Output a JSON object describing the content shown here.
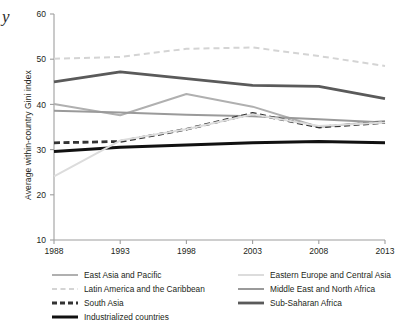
{
  "stray_glyph": "y",
  "axis": {
    "y_title": "Average within-country Gini index",
    "y_ticks": [
      "60",
      "50",
      "40",
      "30",
      "20",
      "10"
    ],
    "x_ticks": [
      "1988",
      "1993",
      "1998",
      "2003",
      "2008",
      "2013"
    ]
  },
  "legend": {
    "left_column": [
      {
        "label": "East Asia and Pacific",
        "style": "solid",
        "color": "#b0b0b0",
        "width": 2.0
      },
      {
        "label": "Latin America and the Caribbean",
        "style": "dashed",
        "color": "#d4d4d4",
        "width": 2.0
      },
      {
        "label": "South Asia",
        "style": "dashed",
        "color": "#333333",
        "width": 2.8
      },
      {
        "label": "Industrialized countries",
        "style": "solid",
        "color": "#111111",
        "width": 3.0
      }
    ],
    "right_column": [
      {
        "label": "Eastern Europe and Central Asia",
        "style": "solid",
        "color": "#dcdcdc",
        "width": 2.0
      },
      {
        "label": "Middle East and North Africa",
        "style": "solid",
        "color": "#9a9a9a",
        "width": 2.0
      },
      {
        "label": "Sub-Saharan Africa",
        "style": "solid",
        "color": "#5a5a5a",
        "width": 2.8
      }
    ]
  },
  "chart_data": {
    "type": "line",
    "title": "",
    "xlabel": "",
    "ylabel": "Average within-country Gini index",
    "x": [
      1988,
      1993,
      1998,
      2003,
      2008,
      2013
    ],
    "xlim": [
      1988,
      2013
    ],
    "ylim": [
      10,
      60
    ],
    "ytick_step": 10,
    "grid": false,
    "legend_position": "below",
    "series": [
      {
        "name": "Latin America and the Caribbean",
        "values": [
          50.1,
          50.5,
          52.3,
          52.6,
          50.7,
          48.5
        ],
        "color": "#d4d4d4",
        "style": "dashed",
        "width": 2.0
      },
      {
        "name": "Sub-Saharan Africa",
        "values": [
          45.0,
          47.2,
          45.7,
          44.2,
          44.0,
          41.3
        ],
        "color": "#5a5a5a",
        "style": "solid",
        "width": 2.8
      },
      {
        "name": "East Asia and Pacific",
        "values": [
          40.1,
          37.6,
          42.3,
          39.5,
          35.0,
          36.3
        ],
        "color": "#b0b0b0",
        "style": "solid",
        "width": 2.0
      },
      {
        "name": "Middle East and North Africa",
        "values": [
          38.6,
          38.2,
          37.7,
          37.4,
          36.7,
          36.0
        ],
        "color": "#9a9a9a",
        "style": "solid",
        "width": 2.0
      },
      {
        "name": "South Asia",
        "values": [
          31.5,
          31.8,
          34.5,
          38.0,
          35.0,
          36.0
        ],
        "color": "#333333",
        "style": "dashed",
        "width": 2.8
      },
      {
        "name": "Industrialized countries",
        "values": [
          29.6,
          30.5,
          31.0,
          31.5,
          31.8,
          31.5
        ],
        "color": "#111111",
        "style": "solid",
        "width": 3.0
      },
      {
        "name": "Eastern Europe and Central Asia",
        "values": [
          24.1,
          32.0,
          34.5,
          37.8,
          35.2,
          36.0
        ],
        "color": "#dcdcdc",
        "style": "solid",
        "width": 2.0
      }
    ]
  }
}
